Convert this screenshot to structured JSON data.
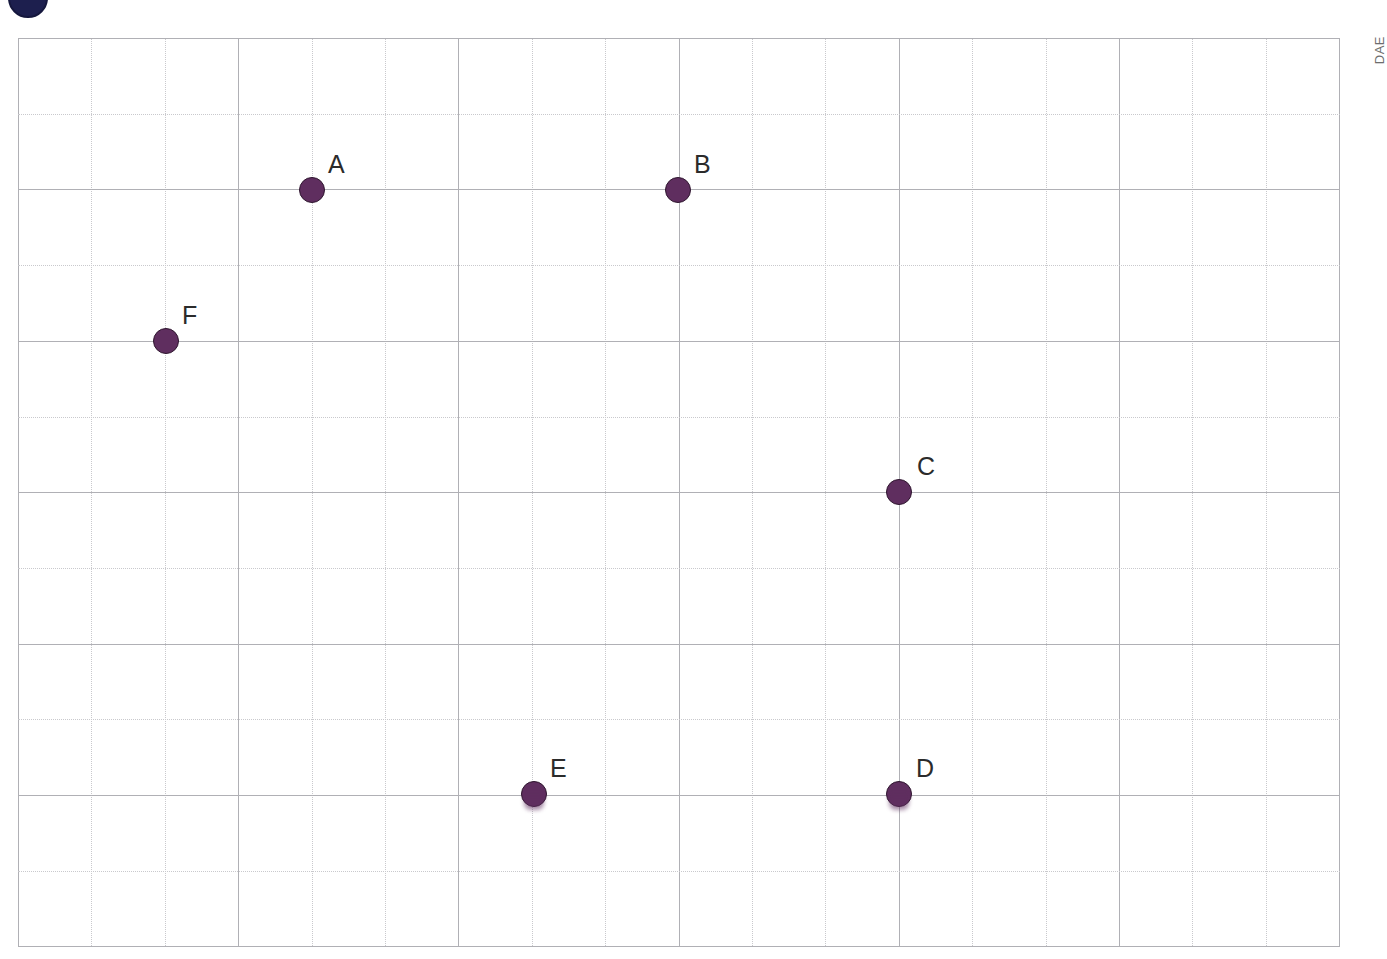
{
  "page": {
    "background_color": "#ffffff",
    "side_caption": "DAE"
  },
  "grid": {
    "left": 18,
    "top": 38,
    "width": 1322,
    "height": 908,
    "columns": 18,
    "rows": 12,
    "cell_width": 73.4,
    "cell_height": 75.7,
    "major_every_column": 3,
    "major_every_row": 2,
    "minor_line_color": "#c9c9cd",
    "major_line_color": "#b0b0b5",
    "minor_line_style": "dotted",
    "major_line_style": "solid"
  },
  "marker_style": {
    "fill_color": "#5f2e5f",
    "outline_color": "#2e152e",
    "diameter_px": 26,
    "label_color": "#2b2b2b",
    "label_font_size_px": 25
  },
  "corner_mark": {
    "name": "partial-navy-circle",
    "color": "#1d1f4e",
    "clipped": "top"
  },
  "chart_data": {
    "type": "scatter",
    "title": "",
    "xlabel": "",
    "ylabel": "",
    "grid": true,
    "legend": "none",
    "xlim": [
      0,
      18
    ],
    "ylim": [
      0,
      12
    ],
    "labels": [
      "A",
      "B",
      "C",
      "D",
      "E",
      "F"
    ],
    "points": [
      {
        "label": "A",
        "x": 4,
        "y": 10,
        "px": 312,
        "py": 190,
        "label_px": 328,
        "label_py": 152,
        "smudged": false
      },
      {
        "label": "B",
        "x": 9,
        "y": 10,
        "px": 678,
        "py": 190,
        "label_px": 694,
        "label_py": 152,
        "smudged": false
      },
      {
        "label": "C",
        "x": 12,
        "y": 6,
        "px": 899,
        "py": 492,
        "label_px": 917,
        "label_py": 454,
        "smudged": false
      },
      {
        "label": "D",
        "x": 12,
        "y": 2,
        "px": 899,
        "py": 794,
        "label_px": 916,
        "label_py": 756,
        "smudged": true
      },
      {
        "label": "E",
        "x": 7,
        "y": 2,
        "px": 534,
        "py": 794,
        "label_px": 550,
        "label_py": 756,
        "smudged": true
      },
      {
        "label": "F",
        "x": 2,
        "y": 8,
        "px": 166,
        "py": 341,
        "label_px": 182,
        "label_py": 303,
        "smudged": false
      }
    ]
  }
}
